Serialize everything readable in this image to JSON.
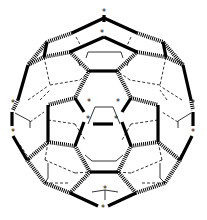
{
  "diagram": {
    "title": "Fullerene C60 bond diagram",
    "marker_glyph": "*",
    "colors": {
      "background": "#ffffff",
      "ink": "#000000"
    },
    "stars": [
      {
        "x": 104,
        "y": 12
      },
      {
        "x": 102,
        "y": 33
      },
      {
        "x": 89,
        "y": 102
      },
      {
        "x": 118,
        "y": 102
      },
      {
        "x": 88,
        "y": 119
      },
      {
        "x": 116,
        "y": 119
      },
      {
        "x": 13,
        "y": 103
      },
      {
        "x": 13,
        "y": 132
      },
      {
        "x": 193,
        "y": 103
      },
      {
        "x": 193,
        "y": 132
      },
      {
        "x": 105,
        "y": 189
      },
      {
        "x": 103,
        "y": 208
      }
    ],
    "bonds": {
      "bold": [
        [
          104,
          15,
          104,
          22
        ],
        [
          104,
          18,
          72,
          33
        ],
        [
          104,
          18,
          137,
          33
        ],
        [
          104,
          37,
          70,
          52
        ],
        [
          104,
          37,
          137,
          52
        ],
        [
          89,
          71,
          117,
          71
        ],
        [
          47,
          42,
          44,
          57
        ],
        [
          163,
          42,
          166,
          57
        ],
        [
          28,
          65,
          18,
          100
        ],
        [
          183,
          65,
          191,
          100
        ],
        [
          75,
          98,
          84,
          112
        ],
        [
          131,
          98,
          122,
          112
        ],
        [
          93,
          124,
          113,
          124
        ],
        [
          48,
          105,
          48,
          142
        ],
        [
          158,
          105,
          158,
          142
        ],
        [
          12,
          112,
          12,
          126
        ],
        [
          193,
          112,
          193,
          126
        ],
        [
          13,
          136,
          27,
          160
        ],
        [
          192,
          136,
          180,
          160
        ],
        [
          84,
          122,
          75,
          146
        ],
        [
          122,
          122,
          131,
          146
        ],
        [
          90,
          172,
          118,
          172
        ],
        [
          70,
          193,
          98,
          206
        ],
        [
          136,
          193,
          108,
          206
        ]
      ],
      "hatch": [
        [
          72,
          33,
          47,
          42
        ],
        [
          137,
          33,
          163,
          42
        ],
        [
          70,
          52,
          44,
          57
        ],
        [
          137,
          52,
          166,
          57
        ],
        [
          47,
          42,
          28,
          65
        ],
        [
          163,
          42,
          183,
          65
        ],
        [
          44,
          57,
          28,
          65
        ],
        [
          166,
          57,
          183,
          65
        ],
        [
          70,
          52,
          89,
          71
        ],
        [
          137,
          52,
          117,
          71
        ],
        [
          89,
          71,
          75,
          98
        ],
        [
          117,
          71,
          131,
          98
        ],
        [
          18,
          100,
          13,
          110
        ],
        [
          191,
          100,
          193,
          110
        ],
        [
          75,
          98,
          48,
          105
        ],
        [
          131,
          98,
          158,
          105
        ],
        [
          48,
          142,
          75,
          146
        ],
        [
          158,
          142,
          131,
          146
        ],
        [
          27,
          160,
          48,
          142
        ],
        [
          180,
          160,
          158,
          142
        ],
        [
          75,
          146,
          90,
          172
        ],
        [
          131,
          146,
          118,
          172
        ],
        [
          27,
          160,
          45,
          183
        ],
        [
          180,
          160,
          165,
          183
        ],
        [
          45,
          183,
          70,
          193
        ],
        [
          165,
          183,
          136,
          193
        ],
        [
          90,
          172,
          70,
          193
        ],
        [
          118,
          172,
          136,
          193
        ]
      ],
      "dash": [
        [
          76,
          37,
          82,
          48
        ],
        [
          131,
          37,
          126,
          48
        ],
        [
          44,
          57,
          50,
          85
        ],
        [
          166,
          57,
          160,
          85
        ],
        [
          50,
          85,
          80,
          80
        ],
        [
          160,
          85,
          130,
          80
        ],
        [
          80,
          80,
          89,
          71
        ],
        [
          130,
          80,
          117,
          71
        ],
        [
          28,
          100,
          48,
          86
        ],
        [
          182,
          100,
          160,
          86
        ],
        [
          30,
          122,
          44,
          112
        ],
        [
          178,
          122,
          162,
          112
        ],
        [
          48,
          120,
          75,
          124
        ],
        [
          158,
          120,
          131,
          124
        ],
        [
          75,
          124,
          85,
          140
        ],
        [
          131,
          124,
          122,
          140
        ],
        [
          45,
          160,
          48,
          142
        ],
        [
          162,
          160,
          158,
          142
        ],
        [
          45,
          160,
          75,
          173
        ],
        [
          162,
          160,
          131,
          173
        ],
        [
          75,
          173,
          90,
          172
        ],
        [
          131,
          173,
          118,
          172
        ],
        [
          45,
          183,
          70,
          183
        ],
        [
          165,
          183,
          140,
          183
        ],
        [
          20,
          145,
          30,
          160
        ],
        [
          187,
          145,
          178,
          160
        ],
        [
          40,
          100,
          50,
          90
        ],
        [
          167,
          100,
          160,
          90
        ]
      ],
      "thin": [
        [
          88,
          52,
          121,
          52
        ],
        [
          88,
          52,
          86,
          58
        ],
        [
          121,
          52,
          123,
          58
        ],
        [
          95,
          107,
          113,
          107
        ],
        [
          95,
          107,
          88,
          124
        ],
        [
          113,
          107,
          120,
          124
        ],
        [
          92,
          161,
          116,
          161
        ],
        [
          92,
          161,
          85,
          155
        ],
        [
          116,
          161,
          123,
          155
        ],
        [
          15,
          113,
          30,
          121
        ],
        [
          30,
          121,
          30,
          128
        ],
        [
          191,
          113,
          178,
          121
        ],
        [
          178,
          121,
          178,
          128
        ],
        [
          48,
          163,
          48,
          178
        ],
        [
          160,
          163,
          160,
          178
        ],
        [
          48,
          178,
          45,
          183
        ],
        [
          160,
          178,
          165,
          183
        ],
        [
          105,
          190,
          105,
          200
        ],
        [
          92,
          192,
          105,
          190
        ],
        [
          118,
          192,
          105,
          190
        ],
        [
          78,
          60,
          80,
          66
        ],
        [
          129,
          60,
          127,
          66
        ]
      ]
    }
  }
}
